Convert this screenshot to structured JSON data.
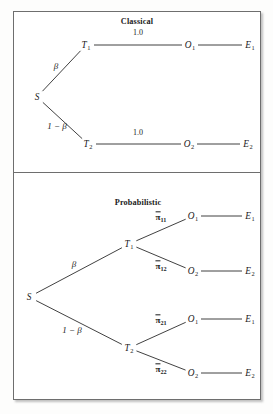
{
  "figure": {
    "name": "decision-tree-figure",
    "panels": [
      {
        "id": "classical",
        "title": "Classical",
        "nodes": [
          {
            "id": "s",
            "label": "S",
            "sub": "",
            "x": 37,
            "y": 97
          },
          {
            "id": "t1",
            "label": "T",
            "sub": "1",
            "x": 86,
            "y": 45
          },
          {
            "id": "t2",
            "label": "T",
            "sub": "2",
            "x": 88,
            "y": 144
          },
          {
            "id": "o1",
            "label": "O",
            "sub": "1",
            "x": 190,
            "y": 45
          },
          {
            "id": "o2",
            "label": "O",
            "sub": "2",
            "x": 189,
            "y": 144
          },
          {
            "id": "e1",
            "label": "E",
            "sub": "1",
            "x": 250,
            "y": 45
          },
          {
            "id": "e2",
            "label": "E",
            "sub": "2",
            "x": 248,
            "y": 144
          }
        ],
        "edges": [
          {
            "from": "s",
            "to": "t1"
          },
          {
            "from": "s",
            "to": "t2"
          },
          {
            "from": "t1",
            "to": "o1"
          },
          {
            "from": "t2",
            "to": "o2"
          },
          {
            "from": "o1",
            "to": "e1"
          },
          {
            "from": "o2",
            "to": "e2"
          }
        ],
        "edge_labels": [
          {
            "id": "beta-upper",
            "text": "β",
            "style": "beta",
            "x": 56,
            "y": 66
          },
          {
            "id": "beta-lower",
            "text": "1 − β",
            "style": "beta",
            "x": 57,
            "y": 126
          },
          {
            "id": "prob-upper",
            "text": "1.0",
            "style": "plain",
            "x": 138,
            "y": 32
          },
          {
            "id": "prob-lower",
            "text": "1.0",
            "style": "plain",
            "x": 138,
            "y": 132
          }
        ],
        "title_pos": {
          "x": 137,
          "y": 17
        }
      },
      {
        "id": "probabilistic",
        "title": "Probabilistic",
        "nodes": [
          {
            "id": "s",
            "label": "S",
            "sub": "",
            "x": 29,
            "y": 297
          },
          {
            "id": "t1",
            "label": "T",
            "sub": "1",
            "x": 129,
            "y": 244
          },
          {
            "id": "t2",
            "label": "T",
            "sub": "2",
            "x": 129,
            "y": 348
          },
          {
            "id": "o11",
            "label": "O",
            "sub": "1",
            "x": 193,
            "y": 216
          },
          {
            "id": "o12",
            "label": "O",
            "sub": "2",
            "x": 193,
            "y": 271
          },
          {
            "id": "o21",
            "label": "O",
            "sub": "1",
            "x": 193,
            "y": 319
          },
          {
            "id": "o22",
            "label": "O",
            "sub": "2",
            "x": 193,
            "y": 373
          },
          {
            "id": "e11",
            "label": "E",
            "sub": "1",
            "x": 250,
            "y": 216
          },
          {
            "id": "e12",
            "label": "E",
            "sub": "2",
            "x": 250,
            "y": 271
          },
          {
            "id": "e21",
            "label": "E",
            "sub": "1",
            "x": 250,
            "y": 319
          },
          {
            "id": "e22",
            "label": "E",
            "sub": "2",
            "x": 250,
            "y": 373
          }
        ],
        "edges": [
          {
            "from": "s",
            "to": "t1"
          },
          {
            "from": "s",
            "to": "t2"
          },
          {
            "from": "t1",
            "to": "o11"
          },
          {
            "from": "t1",
            "to": "o12"
          },
          {
            "from": "t2",
            "to": "o21"
          },
          {
            "from": "t2",
            "to": "o22"
          },
          {
            "from": "o11",
            "to": "e11"
          },
          {
            "from": "o12",
            "to": "e12"
          },
          {
            "from": "o21",
            "to": "e21"
          },
          {
            "from": "o22",
            "to": "e22"
          }
        ],
        "edge_labels": [
          {
            "id": "beta-upper",
            "text": "β",
            "style": "beta",
            "x": 74,
            "y": 264
          },
          {
            "id": "beta-lower",
            "text": "1 − β",
            "style": "beta",
            "x": 72,
            "y": 330
          },
          {
            "id": "pi11",
            "text": "π",
            "sub": "11",
            "style": "pi",
            "x": 161,
            "y": 217
          },
          {
            "id": "pi12",
            "text": "π",
            "sub": "12",
            "style": "pi",
            "x": 161,
            "y": 266
          },
          {
            "id": "pi21",
            "text": "π",
            "sub": "21",
            "style": "pi",
            "x": 161,
            "y": 320
          },
          {
            "id": "pi22",
            "text": "π",
            "sub": "22",
            "style": "pi",
            "x": 161,
            "y": 369
          }
        ],
        "title_pos": {
          "x": 138,
          "y": 198
        }
      }
    ],
    "colors": {
      "line": "#2b2b2b",
      "frame": "#6e6e6e",
      "text": "#1a1a1a",
      "background": "#ffffff"
    }
  }
}
